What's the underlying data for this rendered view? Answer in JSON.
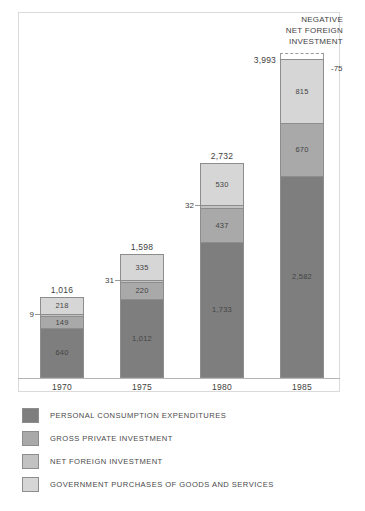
{
  "chart_data": {
    "type": "bar",
    "subtype": "stacked-column",
    "title": "",
    "xlabel": "",
    "ylabel": "",
    "categories": [
      "1970",
      "1975",
      "1980",
      "1985"
    ],
    "totals": [
      "1,016",
      "1,598",
      "2,732",
      "3,993"
    ],
    "totals_numeric": [
      1016,
      1598,
      2732,
      3993
    ],
    "ylim": [
      0,
      4100
    ],
    "grid": false,
    "legend_position": "bottom-left",
    "series": [
      {
        "name": "PERSONAL CONSUMPTION EXPENDITURES",
        "color": "#7e7e7e",
        "values": [
          640,
          1012,
          1733,
          2582
        ],
        "labels": [
          "640",
          "1,012",
          "1,733",
          "2,582"
        ]
      },
      {
        "name": "GROSS PRIVATE INVESTMENT",
        "color": "#a9a9a9",
        "values": [
          149,
          220,
          437,
          670
        ],
        "labels": [
          "149",
          "220",
          "437",
          "670"
        ]
      },
      {
        "name": "NET FOREIGN INVESTMENT",
        "color": "#c2c2c2",
        "values": [
          9,
          31,
          32,
          -75
        ],
        "labels": [
          "9",
          "31",
          "32",
          "-75"
        ]
      },
      {
        "name": "GOVERNMENT PURCHASES OF GOODS AND SERVICES",
        "color": "#d6d6d6",
        "values": [
          218,
          335,
          530,
          815
        ],
        "labels": [
          "218",
          "335",
          "530",
          "815"
        ]
      }
    ],
    "annotations": [
      {
        "id": "negative-net-foreign-investment",
        "lines": [
          "NEGATIVE",
          "NET FOREIGN",
          "INVESTMENT"
        ],
        "value": "-75",
        "attached_to": "1985"
      }
    ]
  },
  "bars": [
    {
      "year": "1970",
      "total": "1,016",
      "segments": [
        {
          "label": "640",
          "swatch": "personal-consumption"
        },
        {
          "label": "149",
          "swatch": "gross-private"
        },
        {
          "label": "9",
          "swatch": "net-foreign"
        },
        {
          "label": "218",
          "swatch": "government"
        }
      ]
    },
    {
      "year": "1975",
      "total": "1,598",
      "segments": [
        {
          "label": "1,012",
          "swatch": "personal-consumption"
        },
        {
          "label": "220",
          "swatch": "gross-private"
        },
        {
          "label": "31",
          "swatch": "net-foreign"
        },
        {
          "label": "335",
          "swatch": "government"
        }
      ]
    },
    {
      "year": "1980",
      "total": "2,732",
      "segments": [
        {
          "label": "1,733",
          "swatch": "personal-consumption"
        },
        {
          "label": "437",
          "swatch": "gross-private"
        },
        {
          "label": "32",
          "swatch": "net-foreign"
        },
        {
          "label": "530",
          "swatch": "government"
        }
      ]
    },
    {
      "year": "1985",
      "total": "3,993",
      "segments": [
        {
          "label": "2,582",
          "swatch": "personal-consumption"
        },
        {
          "label": "670",
          "swatch": "gross-private"
        },
        {
          "label": "815",
          "swatch": "government"
        },
        {
          "label": "-75",
          "swatch": "net-foreign-negative"
        }
      ]
    }
  ],
  "annotation": {
    "line1": "NEGATIVE",
    "line2": "NET FOREIGN",
    "line3": "INVESTMENT",
    "value": "-75"
  },
  "legend": {
    "items": [
      {
        "label": "PERSONAL CONSUMPTION EXPENDITURES",
        "color": "#7e7e7e"
      },
      {
        "label": "GROSS PRIVATE INVESTMENT",
        "color": "#a9a9a9"
      },
      {
        "label": "NET FOREIGN INVESTMENT",
        "color": "#c2c2c2"
      },
      {
        "label": "GOVERNMENT PURCHASES OF GOODS AND SERVICES",
        "color": "#d6d6d6"
      }
    ]
  },
  "colors": {
    "personal_consumption": "#7e7e7e",
    "gross_private": "#a9a9a9",
    "net_foreign": "#c2c2c2",
    "government": "#d6d6d6",
    "frame": "#dadada",
    "outline": "#8d8d8d",
    "text": "#3f3f3f",
    "background": "#ffffff"
  }
}
